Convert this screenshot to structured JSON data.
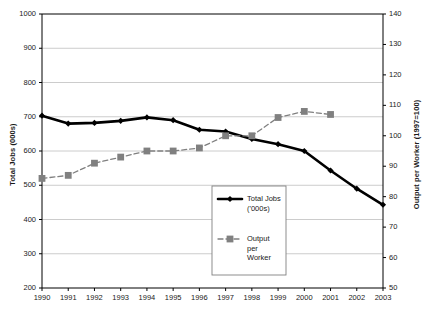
{
  "chart_data": {
    "type": "line",
    "title": "",
    "xlabel": "",
    "categories": [
      "1990",
      "1991",
      "1992",
      "1993",
      "1994",
      "1995",
      "1996",
      "1997",
      "1998",
      "1999",
      "2000",
      "2001",
      "2002",
      "2003"
    ],
    "grid": true,
    "legend_position": "inside-bottom-center",
    "axes": {
      "left": {
        "label": "Total Jobs (000s)",
        "min": 200,
        "max": 1000,
        "step": 100,
        "ticks": [
          "200",
          "300",
          "400",
          "500",
          "600",
          "700",
          "800",
          "900",
          "1000"
        ]
      },
      "right": {
        "label": "Output per Worker (1997=100)",
        "min": 50,
        "max": 140,
        "step": 10,
        "ticks": [
          "50",
          "60",
          "70",
          "80",
          "90",
          "100",
          "110",
          "120",
          "130",
          "140"
        ]
      }
    },
    "series": [
      {
        "name": "Total Jobs ('000s)",
        "legend_label": "Total Jobs\n('000s)",
        "axis": "left",
        "color": "#000000",
        "marker": "diamond",
        "line_style": "solid",
        "line_width": 2.6,
        "values": [
          703,
          680,
          682,
          688,
          698,
          690,
          662,
          657,
          635,
          620,
          600,
          543,
          490,
          443
        ]
      },
      {
        "name": "Output per Worker",
        "legend_label": "Output\nper\nWorker",
        "axis": "right",
        "color": "#808080",
        "marker": "square",
        "line_style": "dashed",
        "line_width": 1.3,
        "values": [
          86,
          87,
          91,
          93,
          95,
          95,
          96,
          100,
          100,
          106,
          108,
          107,
          null,
          null
        ]
      }
    ]
  },
  "colors": {
    "plot_border": "#000000",
    "gridline": "#bfbfbf",
    "background": "#ffffff",
    "series_jobs": "#000000",
    "series_output": "#808080",
    "legend_border": "#808080"
  }
}
